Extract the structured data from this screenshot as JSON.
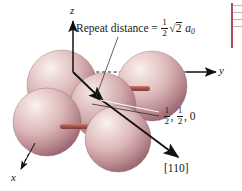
{
  "figure": {
    "kind": "crystal-structure-diagram",
    "background_color": "#ffffff",
    "width": 242,
    "height": 191
  },
  "axes": [
    {
      "name": "z",
      "label": "z",
      "direction": "up",
      "style": "solid-arrow-with-dashed-tail"
    },
    {
      "name": "y",
      "label": "y",
      "direction": "right",
      "style": "dashed-then-solid-arrow"
    },
    {
      "name": "x",
      "label": "x",
      "direction": "down-left",
      "style": "dashed-with-solid-arrowhead"
    }
  ],
  "annotations": {
    "repeat_distance": {
      "prefix": "Repeat distance = ",
      "fraction_numerator": "1",
      "fraction_denominator": "2",
      "radical_symbol": "√",
      "radicand": "2",
      "lattice_parameter": "a",
      "lattice_parameter_subscript": "0"
    },
    "coordinate": {
      "first_numerator": "1",
      "first_denominator": "2",
      "separator_1": ", ",
      "second_numerator": "1",
      "second_denominator": "2",
      "separator_2": ", ",
      "third_value": "0"
    },
    "direction_index": "[110]"
  },
  "colors": {
    "sphere_light": "#f3e3e2",
    "sphere_mid": "#d9b3b3",
    "sphere_dark": "#a9757c",
    "sphere_edge": "#8d5f68",
    "bond_rod": "#a8544e",
    "axis_line": "#1a1a1a",
    "leader_line": "#3a3a3a",
    "sidebar_rule": "#9c3242"
  },
  "atoms": [
    {
      "id": "corner-back-left",
      "cx": 62,
      "cy": 85,
      "r": 35
    },
    {
      "id": "face-front-left",
      "cx": 47,
      "cy": 122,
      "r": 34
    },
    {
      "id": "face-center",
      "cx": 103,
      "cy": 106,
      "r": 33
    },
    {
      "id": "corner-front",
      "cx": 118,
      "cy": 138,
      "r": 33
    },
    {
      "id": "corner-right",
      "cx": 152,
      "cy": 86,
      "r": 35
    }
  ],
  "bonds": [
    {
      "id": "rod-lower-horizontal",
      "x": 62,
      "y": 126,
      "length": 50,
      "thickness": 5
    },
    {
      "id": "rod-upper-stub",
      "x": 128,
      "y": 88,
      "length": 22,
      "thickness": 5
    }
  ]
}
